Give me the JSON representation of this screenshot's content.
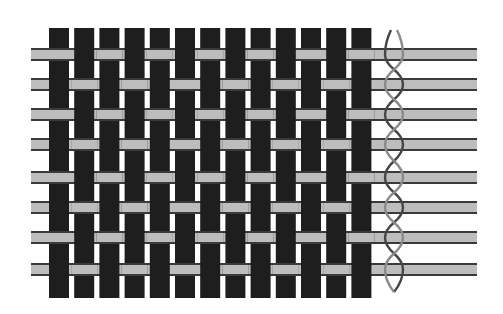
{
  "diagram": {
    "type": "plain-weave-with-leno-selvage",
    "canvas": {
      "width": 503,
      "height": 314,
      "background": "#ffffff"
    },
    "colors": {
      "warp": "#1e1e1e",
      "weft_fill": "#bdbdbd",
      "weft_border": "#3a3a3a",
      "leno_dark": "#454545",
      "leno_light": "#8a8a8a"
    },
    "warps": {
      "count": 13,
      "x_start": 49,
      "pitch": 25.2,
      "width": 20,
      "y_top": 28,
      "y_bottom": 298
    },
    "wefts": {
      "count": 8,
      "y_tops": [
        48,
        78,
        108,
        138,
        171,
        201,
        231,
        263
      ],
      "height": 13,
      "x_left": 31,
      "x_right": 477,
      "border": 2
    },
    "interlacing": {
      "pattern": "plain",
      "odd_wefts_over": "odd warps",
      "even_wefts_over": "even warps"
    },
    "leno": {
      "x_center": 394,
      "amplitude": 9,
      "y_top": 30,
      "y_bottom": 292,
      "stroke_width": 2.4
    }
  }
}
